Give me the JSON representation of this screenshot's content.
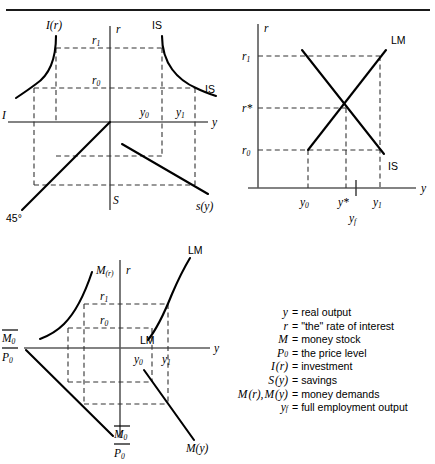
{
  "figure": {
    "title_rule": true,
    "domain": "IS-LM derivation four-quadrant diagram"
  },
  "panels": {
    "investment_savings": {
      "name": "IS curve derivation",
      "axis_labels": {
        "vertical_top": "r",
        "vertical_bottom": "S",
        "horizontal_right": "y",
        "horizontal_left": "I"
      },
      "curves": [
        {
          "id": "I_r",
          "label": "I(r)",
          "shape": "convex-decreasing"
        },
        {
          "id": "IS_top",
          "label": "IS",
          "shape": "convex-decreasing"
        },
        {
          "id": "IS_end",
          "label": "IS"
        },
        {
          "id": "forty_five",
          "label": "45°",
          "shape": "line"
        },
        {
          "id": "s_y",
          "label": "s(y)",
          "shape": "line"
        }
      ],
      "rate_ticks": [
        "r₁",
        "r₀"
      ],
      "output_ticks": [
        "y₀",
        "y₁"
      ]
    },
    "islm": {
      "name": "IS-LM equilibrium",
      "axis_labels": {
        "vertical": "r",
        "horizontal": "y"
      },
      "curves": [
        {
          "id": "LM",
          "label": "LM",
          "shape": "upward-sloping"
        },
        {
          "id": "IS",
          "label": "IS",
          "shape": "downward-sloping"
        }
      ],
      "rate_ticks": [
        "r₁",
        "r*",
        "r₀"
      ],
      "output_ticks": [
        "y₀",
        "y*",
        "y₁"
      ],
      "full_employment_tick": "y_f"
    },
    "money_market": {
      "name": "LM curve derivation",
      "axis_labels": {
        "vertical_top": "r",
        "horizontal_right": "y"
      },
      "curves": [
        {
          "id": "M_r",
          "label": "M(r)",
          "shape": "convex-decreasing"
        },
        {
          "id": "LM_top",
          "label": "LM",
          "shape": "upward-sloping"
        },
        {
          "id": "LM_low",
          "label": "LM"
        },
        {
          "id": "M_y",
          "label": "M(y)",
          "shape": "downward-sloping"
        },
        {
          "id": "budget_line",
          "label": "M̄₀ / P̄₀",
          "shape": "line"
        }
      ],
      "rate_ticks": [
        "r₁",
        "r₀"
      ],
      "output_ticks": [
        "y₀",
        "y₁"
      ],
      "real_balance_label": {
        "numerator": "M",
        "numerator_sub": "0",
        "denominator": "P",
        "denominator_sub": "0"
      }
    }
  },
  "legend": {
    "rows": [
      {
        "symbol_html": "y",
        "definition": "= real output"
      },
      {
        "symbol_html": "r",
        "definition": "= \"the\" rate of interest"
      },
      {
        "symbol_html": "M",
        "definition": "= money stock"
      },
      {
        "symbol_html": "P0",
        "definition": "= the price level"
      },
      {
        "symbol_html": "I(r)",
        "definition": "= investment"
      },
      {
        "symbol_html": "S(y)",
        "definition": "= savings"
      },
      {
        "symbol_html": "M(r), M(y)",
        "definition": "= money demands"
      },
      {
        "symbol_html": "yf",
        "definition": "= full employment output"
      }
    ]
  },
  "colors": {
    "ink": "#000000",
    "axis": "#5a5a5a",
    "dash": "#333333"
  }
}
